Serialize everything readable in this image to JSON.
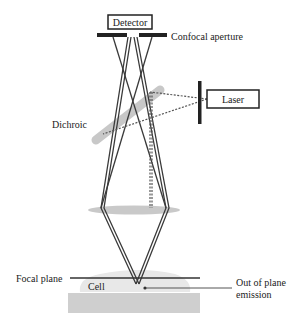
{
  "labels": {
    "detector": "Detector",
    "confocal_aperture": "Confocal aperture",
    "laser": "Laser",
    "dichroic": "Dichroic",
    "focal_plane": "Focal plane",
    "cell": "Cell",
    "out_of_plane_line1": "Out of plane",
    "out_of_plane_line2": "emission"
  },
  "colors": {
    "ray": "#3a3a3a",
    "dichroic": "#c8c8c8",
    "lens": "#c9c9c9",
    "cell": "#e6e6e6",
    "coverslip": "#cfcfcf",
    "box_border": "#222222"
  }
}
